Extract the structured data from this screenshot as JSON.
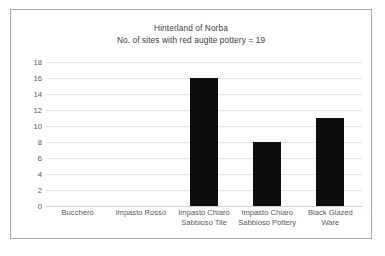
{
  "chart_data": {
    "type": "bar",
    "title": "Hinterland of Norba",
    "subtitle": "No. of sites with red augite pottery = 19",
    "categories": [
      "Bucchero",
      "Impasto Rosso",
      "Impasto Chiaro Sabbioso Tile",
      "Impasto Chiaro Sabbioso Pottery",
      "Black Glazed Ware"
    ],
    "values": [
      0,
      0,
      16,
      8,
      11
    ],
    "xlabel": "",
    "ylabel": "",
    "ylim": [
      0,
      18
    ],
    "yticks": [
      0,
      2,
      4,
      6,
      8,
      10,
      12,
      14,
      16,
      18
    ],
    "grid": true,
    "legend": false,
    "bar_color": "#0d0d0d",
    "gridline_color": "#e4e4e4",
    "text_color": "#595959",
    "border_color": "#a6a6a6"
  }
}
